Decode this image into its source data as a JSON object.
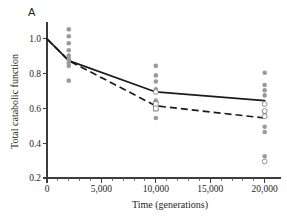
{
  "panel": {
    "label": "A"
  },
  "chart_data": {
    "type": "scatter",
    "title": "",
    "subtitle": "",
    "xlabel": "Time (generations)",
    "ylabel": "Total catabolic function",
    "xlim": [
      0,
      21500
    ],
    "ylim": [
      0.2,
      1.08
    ],
    "grid": false,
    "legend": "none",
    "x_ticks": [
      0,
      5000,
      10000,
      15000,
      20000
    ],
    "x_tick_labels": [
      "0",
      "5,000",
      "10,000",
      "15,000",
      "20,000"
    ],
    "x_minor_tick_interval": 1000,
    "y_ticks": [
      0.2,
      0.4,
      0.6,
      0.8,
      1.0
    ],
    "y_tick_labels": [
      "0.2",
      "0.4",
      "0.6",
      "0.8",
      "1.0"
    ],
    "series": [
      {
        "name": "solid-fit",
        "style": "solid",
        "color": "#1b1b1b",
        "x": [
          0,
          2000,
          10000,
          20000
        ],
        "values": [
          1.0,
          0.875,
          0.695,
          0.645
        ]
      },
      {
        "name": "dashed-fit",
        "style": "dashed",
        "color": "#1b1b1b",
        "x": [
          0,
          2000,
          10000,
          20000
        ],
        "values": [
          1.0,
          0.875,
          0.615,
          0.545
        ]
      },
      {
        "name": "filled-points",
        "style": "filled-circle",
        "color": "#9a9a9a",
        "points": [
          {
            "x": 2000,
            "y": 1.055
          },
          {
            "x": 2000,
            "y": 1.015
          },
          {
            "x": 2000,
            "y": 0.975
          },
          {
            "x": 2000,
            "y": 0.935
          },
          {
            "x": 2000,
            "y": 0.905
          },
          {
            "x": 2000,
            "y": 0.885
          },
          {
            "x": 2000,
            "y": 0.865
          },
          {
            "x": 2000,
            "y": 0.845
          },
          {
            "x": 2000,
            "y": 0.76
          },
          {
            "x": 10000,
            "y": 0.845
          },
          {
            "x": 10000,
            "y": 0.79
          },
          {
            "x": 10000,
            "y": 0.755
          },
          {
            "x": 10000,
            "y": 0.71
          },
          {
            "x": 10000,
            "y": 0.645
          },
          {
            "x": 10000,
            "y": 0.595
          },
          {
            "x": 10000,
            "y": 0.545
          },
          {
            "x": 20000,
            "y": 0.805
          },
          {
            "x": 20000,
            "y": 0.735
          },
          {
            "x": 20000,
            "y": 0.705
          },
          {
            "x": 20000,
            "y": 0.675
          },
          {
            "x": 20000,
            "y": 0.58
          },
          {
            "x": 20000,
            "y": 0.495
          },
          {
            "x": 20000,
            "y": 0.465
          },
          {
            "x": 20000,
            "y": 0.325
          }
        ]
      },
      {
        "name": "open-circle-points",
        "style": "open-circle",
        "color": "#8f8f8f",
        "points": [
          {
            "x": 10000,
            "y": 0.695
          },
          {
            "x": 20000,
            "y": 0.625
          },
          {
            "x": 20000,
            "y": 0.585
          },
          {
            "x": 20000,
            "y": 0.555
          },
          {
            "x": 20000,
            "y": 0.295
          }
        ]
      },
      {
        "name": "open-square-points",
        "style": "open-square",
        "color": "#8f8f8f",
        "points": [
          {
            "x": 10000,
            "y": 0.625
          },
          {
            "x": 10000,
            "y": 0.6
          }
        ]
      }
    ]
  }
}
